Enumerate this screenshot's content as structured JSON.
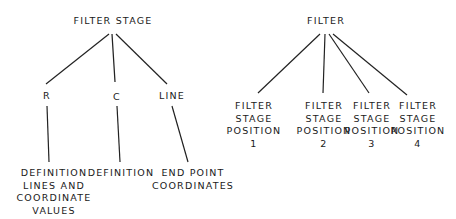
{
  "left_tree": {
    "root": "FILTER STAGE",
    "children": [
      {
        "label": "R",
        "leaf": [
          "DEFINITION",
          "LINES AND",
          "COORDINATE",
          "VALUES"
        ]
      },
      {
        "label": "C",
        "leaf": [
          "DEFINITION"
        ]
      },
      {
        "label": "LINE",
        "leaf": [
          "END POINT",
          "COORDINATES"
        ]
      }
    ]
  },
  "right_tree": {
    "root": "FILTER",
    "children": [
      {
        "label": [
          "FILTER",
          "STAGE",
          "POSITION",
          "1"
        ]
      },
      {
        "label": [
          "FILTER",
          "STAGE",
          "POSITION",
          "2"
        ]
      },
      {
        "label": [
          "FILTER",
          "STAGE",
          "POSITION",
          "3"
        ]
      },
      {
        "label": [
          "FILTER",
          "STAGE",
          "POSITION",
          "4"
        ]
      }
    ]
  }
}
